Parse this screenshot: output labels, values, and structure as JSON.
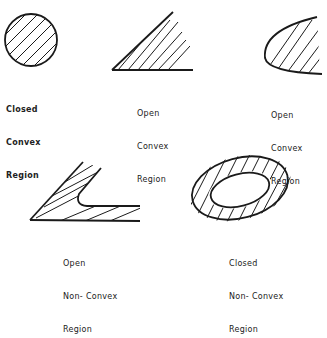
{
  "diagram": {
    "colors": {
      "stroke": "#1a1a1a",
      "background": "#ffffff"
    },
    "regions": [
      {
        "id": "closed-convex",
        "lines": [
          "Closed",
          "Convex",
          "Region"
        ]
      },
      {
        "id": "open-convex-wedge",
        "lines": [
          "Open",
          "Convex",
          "Region"
        ]
      },
      {
        "id": "open-convex-curve",
        "lines": [
          "Open",
          "Convex",
          "Region"
        ]
      },
      {
        "id": "open-non-convex",
        "lines": [
          "Open",
          "Non- Convex",
          "Region"
        ]
      },
      {
        "id": "closed-non-convex",
        "lines": [
          "Closed",
          "Non- Convex",
          "Region"
        ]
      }
    ]
  }
}
